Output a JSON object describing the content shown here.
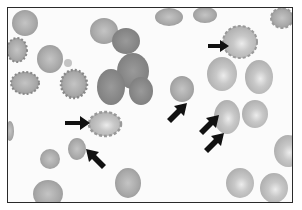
{
  "figure": {
    "background_color": "#fbfbfb",
    "border_color": "#2a2a2a",
    "cell_color": "#a8a8a8",
    "cell_dark_color": "#8e8e8e",
    "arrow_color": "#111111",
    "arrow_count": 7
  }
}
